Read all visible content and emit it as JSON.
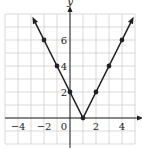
{
  "chart_data": {
    "type": "line",
    "title": "",
    "xlabel": "x",
    "ylabel": "y",
    "xlim": [
      -5,
      5
    ],
    "ylim": [
      -2,
      8
    ],
    "grid": true,
    "x_ticks": [
      -4,
      -2,
      0,
      2,
      4
    ],
    "y_ticks": [
      2,
      4,
      6
    ],
    "x_tick_labels": [
      "-4",
      "-2",
      "0",
      "2",
      "4"
    ],
    "y_tick_labels": [
      "2",
      "4",
      "6"
    ],
    "series": [
      {
        "name": "y = 2|x - 1|",
        "x": [
          -2,
          -1,
          0,
          1,
          2,
          3,
          4
        ],
        "y": [
          6,
          4,
          2,
          0,
          2,
          4,
          6
        ],
        "markers": true,
        "arrows_at_ends": true
      }
    ]
  },
  "axes": {
    "x_label": "x",
    "y_label": "y"
  }
}
